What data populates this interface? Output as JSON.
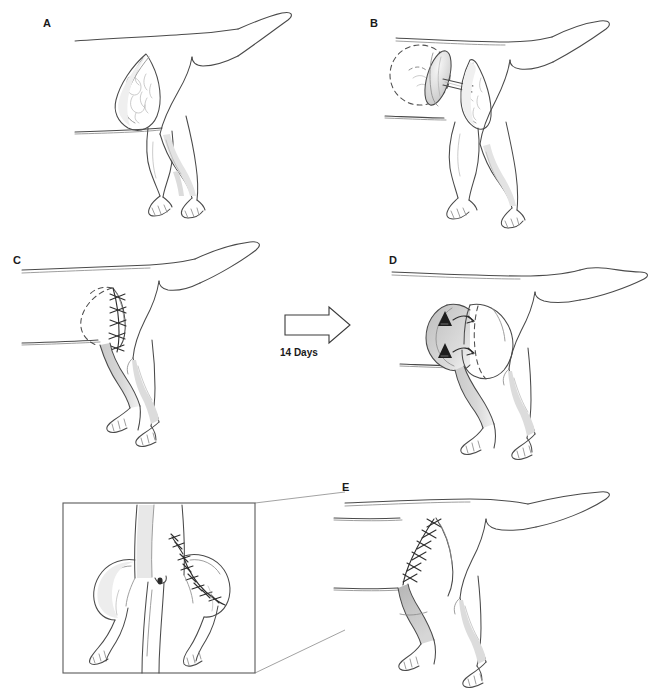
{
  "figure": {
    "width": 668,
    "height": 688,
    "background_color": "#ffffff",
    "ink_color": "#4a4a4a",
    "shade_color": "#b9b9b9",
    "marker_color": "#1d1d1d"
  },
  "panels": [
    {
      "id": "A",
      "label": "A",
      "label_x": 48,
      "label_y": 20,
      "description": "Lateral view of dog hindquarters showing a leaf-shaped nodular tumor mass on the flank before surgery",
      "features": [
        "dog-hindquarter-outline",
        "tail",
        "tumor-lesion",
        "nodular-texture",
        "hind-limbs",
        "paws"
      ]
    },
    {
      "id": "B",
      "label": "B",
      "label_x": 375,
      "label_y": 20,
      "description": "Skin flap elevated on a narrow pedicle and rotated away from the donor site; dashed circle marks the donor bed and the tumor bed is open",
      "features": [
        "dashed-donor-circle",
        "elevated-flap",
        "pedicle-bridge",
        "open-wound-bed",
        "dog-hindquarter-outline",
        "tail"
      ]
    },
    {
      "id": "C",
      "label": "C",
      "label_x": 16,
      "label_y": 257,
      "description": "Flap sutured into the recipient defect with an interrupted cruciate suture line; dashed line marks the original flap margin and the limb is wrapped by the flap",
      "features": [
        "suture-line",
        "dashed-flap-margin",
        "shaded-flap-band",
        "dog-hindquarter-outline",
        "tail"
      ]
    },
    {
      "id": "D",
      "label": "D",
      "label_x": 392,
      "label_y": 257,
      "description": "After 14 days the pedicle is divided; two solid triangles with curved arrows mark the division points and the direction of inset",
      "features": [
        "division-triangles",
        "curved-arrows",
        "shaded-pedicle",
        "dashed-inset-line",
        "dog-hindquarter-outline",
        "tail"
      ]
    },
    {
      "id": "E",
      "label": "E",
      "label_x": 345,
      "label_y": 484,
      "description": "Final healed result: closed suture line on the flank and the transferred flap covering the limb defect",
      "features": [
        "healed-suture-line",
        "grafted-patch",
        "dog-hindquarter-outline",
        "tail"
      ]
    }
  ],
  "transition": {
    "arrow_name": "right-block-arrow",
    "caption": "14 Days",
    "caption_x": 280,
    "caption_y": 350,
    "direction": "right"
  },
  "inset": {
    "name": "caudal-view-inset",
    "description": "Magnified caudal (rear) view of the dog showing the sutured flank incision and the flap sutured around the left hind limb",
    "box": {
      "x": 63,
      "y": 503,
      "width": 192,
      "height": 170
    },
    "connects_to_panel": "E",
    "features": [
      "rear-view-body",
      "tail-base",
      "suture-line-flank",
      "suture-line-limb",
      "hind-limbs",
      "paws"
    ]
  }
}
